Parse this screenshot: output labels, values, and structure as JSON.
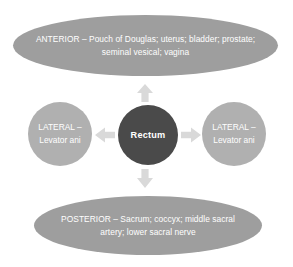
{
  "diagram": {
    "type": "relationship-map",
    "colors": {
      "ellipse_fill": "#9e9e9e",
      "circle_fill": "#b0b0b0",
      "center_fill": "#4a4a4a",
      "arrow_fill": "#d9d9d9",
      "text": "#ffffff",
      "background": "#ffffff"
    },
    "center": {
      "label": "Rectum"
    },
    "nodes": {
      "anterior": {
        "label": "ANTERIOR – Pouch of Douglas; uterus; bladder; prostate; seminal vesical; vagina",
        "position": "top"
      },
      "posterior": {
        "label": "POSTERIOR – Sacrum; coccyx; middle sacral artery; lower sacral nerve",
        "position": "bottom"
      },
      "lateral_left": {
        "label": "LATERAL – Levator ani",
        "position": "left"
      },
      "lateral_right": {
        "label": "LATERAL – Levator ani",
        "position": "right"
      }
    },
    "arrows": [
      {
        "name": "arrow-up-icon",
        "direction": "up"
      },
      {
        "name": "arrow-down-icon",
        "direction": "down"
      },
      {
        "name": "arrow-left-icon",
        "direction": "left"
      },
      {
        "name": "arrow-right-icon",
        "direction": "right"
      }
    ]
  }
}
